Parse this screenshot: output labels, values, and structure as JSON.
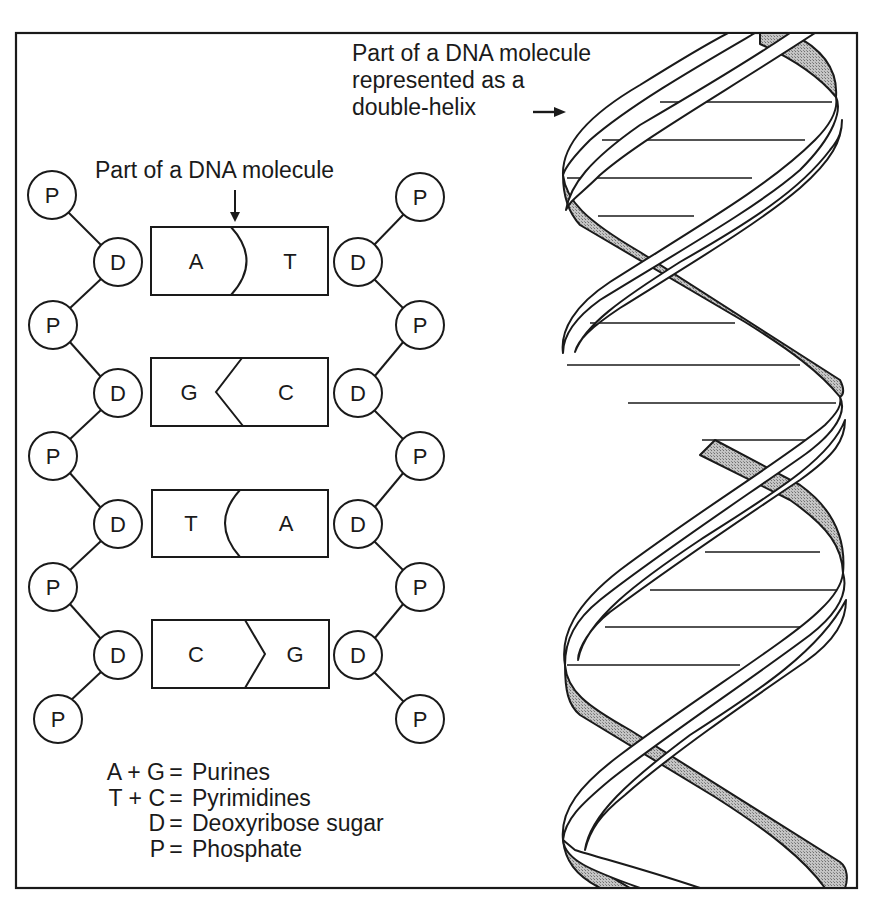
{
  "labels": {
    "ladder_title": "Part of a DNA molecule",
    "helix_title_lines": [
      "Part of a DNA molecule",
      "represented as a",
      "double-helix"
    ]
  },
  "ladder": {
    "left_strand": [
      "P",
      "D",
      "P",
      "D",
      "P",
      "D",
      "P",
      "D",
      "P",
      "D",
      "P"
    ],
    "right_strand": [
      "P",
      "D",
      "P",
      "D",
      "P",
      "D",
      "P",
      "D",
      "P",
      "D",
      "P"
    ],
    "node_labels": {
      "phosphate": "P",
      "sugar": "D"
    },
    "base_pairs": [
      {
        "left": "A",
        "right": "T",
        "bond_shape": "curve-right"
      },
      {
        "left": "G",
        "right": "C",
        "bond_shape": "chevron-left"
      },
      {
        "left": "T",
        "right": "A",
        "bond_shape": "curve-left"
      },
      {
        "left": "C",
        "right": "G",
        "bond_shape": "chevron-right"
      }
    ]
  },
  "legend": [
    {
      "left": "A + G",
      "eq": "=",
      "right": "Purines"
    },
    {
      "left": "T + C",
      "eq": "=",
      "right": "Pyrimidines"
    },
    {
      "left": "D",
      "eq": "=",
      "right": "Deoxyribose sugar"
    },
    {
      "left": "P",
      "eq": "=",
      "right": "Phosphate"
    }
  ],
  "colors": {
    "ink": "#1a1a1a",
    "background": "#ffffff",
    "ribbon_shade": "#a9a9a9"
  }
}
